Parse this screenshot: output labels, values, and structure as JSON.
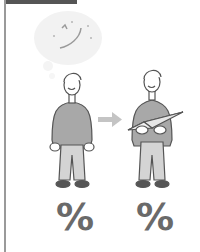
{
  "illustration": {
    "thought_bubble": {
      "icon": "orbit-planet-icon"
    },
    "figure_left": {
      "icon": "man-standing-icon"
    },
    "arrow": {
      "icon": "arrow-right-icon",
      "color": "#bdbdbd"
    },
    "figure_right": {
      "icon": "man-holding-paper-airplane-icon",
      "held_object": "paper-airplane-icon"
    }
  },
  "labels": {
    "left_percent": "%",
    "right_percent": "%"
  },
  "colors": {
    "outline": "#555555",
    "shirt": "#a8a8a8",
    "pants": "#d4d4d4",
    "shoes": "#555555",
    "bubble": "#f1f1f1",
    "percent": "#6a6a6a",
    "rule": "#9a9a9a"
  }
}
